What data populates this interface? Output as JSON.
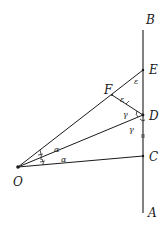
{
  "diagram": {
    "colors": {
      "ink": "#1a1a1a",
      "background": "#ffffff"
    },
    "points": {
      "O": {
        "label": "O",
        "x": 18,
        "y": 167
      },
      "A": {
        "label": "A",
        "x": 143,
        "y": 213
      },
      "B": {
        "label": "B",
        "x": 143,
        "y": 30
      },
      "C": {
        "label": "C",
        "x": 143,
        "y": 156
      },
      "D": {
        "label": "D",
        "x": 143,
        "y": 115
      },
      "E": {
        "label": "E",
        "x": 143,
        "y": 70
      },
      "F": {
        "label": "F",
        "x": 112,
        "y": 95
      }
    },
    "labels": {
      "A": "A",
      "B": "B",
      "C": "C",
      "D": "D",
      "E": "E",
      "F": "F",
      "O": "O"
    },
    "angle_labels": {
      "alpha_upper": "α",
      "alpha_lower": "α",
      "epsilon_at_E": "ε",
      "epsilon_at_F": "ε",
      "gamma_upper_at_D": "γ",
      "gamma_lower_at_D": "γ"
    },
    "segments": [
      {
        "name": "line-AB",
        "from": "A",
        "to": "B"
      },
      {
        "name": "segment-OE",
        "from": "O",
        "to": "E"
      },
      {
        "name": "segment-OD",
        "from": "O",
        "to": "D"
      },
      {
        "name": "segment-OC",
        "from": "O",
        "to": "C"
      },
      {
        "name": "segment-FD",
        "from": "F",
        "to": "D"
      }
    ]
  }
}
